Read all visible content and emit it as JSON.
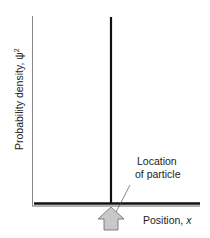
{
  "diagram": {
    "y_axis_label": "Probability density, ψ",
    "y_axis_superscript": "2",
    "x_axis_label_prefix": "Position, ",
    "x_axis_label_var": "x",
    "annotation_line1": "Location",
    "annotation_line2": "of particle",
    "colors": {
      "axis": "#888888",
      "baseline": "#111111",
      "spike": "#111111",
      "arrow_fill": "#c8c8c8",
      "arrow_stroke": "#666666"
    }
  }
}
